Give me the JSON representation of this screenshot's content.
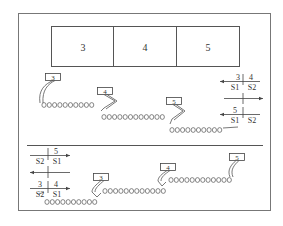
{
  "diagram": {
    "segments": [
      "3",
      "4",
      "5"
    ],
    "top_panel": {
      "tags": [
        "3",
        "4",
        "5"
      ],
      "legend": [
        {
          "direction": "left",
          "top_left": "3",
          "top_right": "4",
          "bottom_left": "S1",
          "bottom_right": "S2"
        },
        {
          "direction": "right",
          "top_left": "",
          "top_right": "",
          "bottom_left": "",
          "bottom_right": ""
        },
        {
          "direction": "left",
          "top_left": "5",
          "top_right": "",
          "bottom_left": "S1",
          "bottom_right": "S2"
        }
      ]
    },
    "bottom_panel": {
      "tags": [
        "3",
        "4",
        "5"
      ],
      "legend": [
        {
          "direction": "right",
          "top_left": "",
          "top_right": "5",
          "bottom_left": "S2",
          "bottom_right": "S1"
        },
        {
          "direction": "left",
          "top_left": "",
          "top_right": "",
          "bottom_left": "",
          "bottom_right": ""
        },
        {
          "direction": "right",
          "top_left": "3",
          "top_right": "4",
          "bottom_left": "S2",
          "bottom_right": "S1"
        }
      ]
    }
  }
}
